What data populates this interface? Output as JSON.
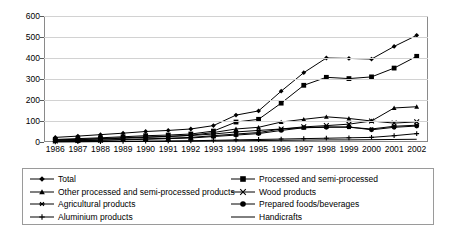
{
  "chart_data": {
    "type": "line",
    "title": "",
    "xlabel": "",
    "ylabel": "",
    "grid": true,
    "legend_position": "bottom",
    "ylim": [
      0,
      600
    ],
    "yticks": [
      0,
      100,
      200,
      300,
      400,
      500,
      600
    ],
    "categories": [
      "1986",
      "1987",
      "1988",
      "1989",
      "1990",
      "1991",
      "1992",
      "1993",
      "1994",
      "1995",
      "1996",
      "1997",
      "1998",
      "1999",
      "2000",
      "2001",
      "2002"
    ],
    "series": [
      {
        "name": "Total",
        "marker": "diamond",
        "values": [
          22,
          28,
          35,
          42,
          50,
          55,
          62,
          78,
          128,
          148,
          242,
          330,
          400,
          398,
          395,
          455,
          508
        ]
      },
      {
        "name": "Processed and semi-processed",
        "marker": "square",
        "values": [
          12,
          16,
          20,
          25,
          30,
          33,
          38,
          52,
          95,
          108,
          185,
          270,
          308,
          302,
          310,
          352,
          408
        ]
      },
      {
        "name": "Other processed and semi-processed products",
        "marker": "triangle",
        "values": [
          8,
          11,
          14,
          18,
          22,
          26,
          32,
          45,
          62,
          70,
          95,
          108,
          120,
          112,
          100,
          162,
          168
        ]
      },
      {
        "name": "Wood products",
        "marker": "x",
        "values": [
          5,
          7,
          9,
          12,
          15,
          18,
          22,
          30,
          38,
          45,
          62,
          72,
          78,
          85,
          100,
          90,
          96
        ]
      },
      {
        "name": "Agricultural products",
        "marker": "asterisk",
        "values": [
          10,
          13,
          16,
          20,
          24,
          27,
          31,
          38,
          48,
          55,
          62,
          68,
          72,
          70,
          62,
          75,
          80
        ]
      },
      {
        "name": "Prepared foods/beverages",
        "marker": "circle",
        "values": [
          4,
          6,
          8,
          10,
          13,
          16,
          19,
          26,
          33,
          40,
          55,
          68,
          70,
          72,
          58,
          70,
          76
        ]
      },
      {
        "name": "Aluminium products",
        "marker": "plus",
        "values": [
          1,
          2,
          2,
          3,
          4,
          5,
          6,
          8,
          10,
          12,
          14,
          16,
          18,
          20,
          22,
          30,
          40
        ]
      },
      {
        "name": "Handicrafts",
        "marker": "none",
        "values": [
          1,
          1,
          2,
          2,
          3,
          3,
          4,
          5,
          6,
          7,
          8,
          9,
          10,
          10,
          11,
          12,
          13
        ]
      }
    ]
  },
  "legend": {
    "left_column": [
      {
        "label": "Total",
        "marker": "diamond"
      },
      {
        "label": "Other processed and semi-processed products",
        "marker": "triangle"
      },
      {
        "label": "Agricultural products",
        "marker": "asterisk"
      },
      {
        "label": "Aluminium products",
        "marker": "plus"
      }
    ],
    "right_column": [
      {
        "label": "Processed and semi-processed",
        "marker": "square"
      },
      {
        "label": "Wood products",
        "marker": "x"
      },
      {
        "label": "Prepared foods/beverages",
        "marker": "circle"
      },
      {
        "label": "Handicrafts",
        "marker": "none"
      }
    ]
  },
  "colors": {
    "line": "#000000",
    "grid": "#d2d2d2",
    "frame": "#8a8a8a",
    "background": "#ffffff"
  }
}
